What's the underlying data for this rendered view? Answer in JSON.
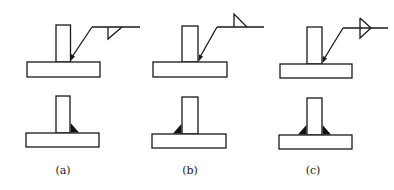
{
  "figure": {
    "colors": {
      "line": "#1a1a1a",
      "weld_fill": "#111111",
      "background": "#ffffff"
    },
    "panels": [
      {
        "id": "a",
        "label": "(a)",
        "symbol": "fillet-below-reference-line",
        "weld_side": "arrow-side (right)"
      },
      {
        "id": "b",
        "label": "(b)",
        "symbol": "fillet-above-reference-line",
        "weld_side": "other-side (left)"
      },
      {
        "id": "c",
        "label": "(c)",
        "symbol": "fillet-both-sides-of-reference-line",
        "weld_side": "both sides"
      }
    ]
  }
}
